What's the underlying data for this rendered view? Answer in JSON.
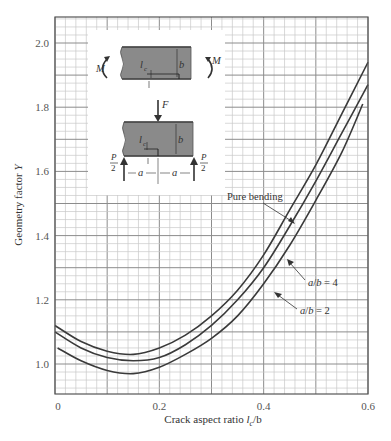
{
  "chart_data": {
    "type": "line",
    "title": "",
    "xlabel": "Crack aspect ratio l_c/b",
    "xlabel_main": "Crack aspect ratio ",
    "xlabel_var": "l",
    "xlabel_sub": "c",
    "xlabel_tail": "/b",
    "ylabel": "Geometry factor Y",
    "ylabel_main": "Geometry factor ",
    "ylabel_var": "Y",
    "xlim": [
      0,
      0.6
    ],
    "ylim": [
      0.9,
      2.08
    ],
    "x_ticks": [
      0,
      0.2,
      0.4,
      0.6
    ],
    "x_tick_labels": [
      "0",
      "0.2",
      "0.4",
      "0.6"
    ],
    "y_ticks": [
      1.0,
      1.2,
      1.4,
      1.6,
      1.8,
      2.0
    ],
    "y_tick_labels": [
      "1.0",
      "1.2",
      "1.4",
      "1.6",
      "1.8",
      "2.0"
    ],
    "grid": true,
    "legend": "inline annotations with leader arrows",
    "series": [
      {
        "name": "Pure bending",
        "x": [
          0,
          0.05,
          0.1,
          0.15,
          0.2,
          0.25,
          0.3,
          0.35,
          0.4,
          0.45,
          0.5,
          0.55,
          0.6
        ],
        "values": [
          1.12,
          1.07,
          1.04,
          1.03,
          1.05,
          1.09,
          1.15,
          1.23,
          1.34,
          1.48,
          1.62,
          1.78,
          1.94
        ]
      },
      {
        "name": "a/b = 4",
        "x": [
          0,
          0.05,
          0.1,
          0.15,
          0.2,
          0.25,
          0.3,
          0.35,
          0.4,
          0.45,
          0.5,
          0.55,
          0.6
        ],
        "values": [
          1.1,
          1.05,
          1.02,
          1.01,
          1.02,
          1.06,
          1.12,
          1.2,
          1.3,
          1.43,
          1.57,
          1.72,
          1.87
        ]
      },
      {
        "name": "a/b = 2",
        "x": [
          0.005,
          0.05,
          0.1,
          0.15,
          0.2,
          0.25,
          0.3,
          0.35,
          0.4,
          0.45,
          0.5,
          0.55,
          0.59
        ],
        "values": [
          1.05,
          1.01,
          0.98,
          0.97,
          0.99,
          1.03,
          1.08,
          1.15,
          1.25,
          1.37,
          1.51,
          1.66,
          1.81
        ]
      }
    ],
    "annotations": [
      {
        "text": "Pure bending",
        "target_series": "Pure bending"
      },
      {
        "text": "a/b = 4",
        "target_series": "a/b = 4"
      },
      {
        "text": "a/b = 2",
        "target_series": "a/b = 2"
      }
    ],
    "inset": {
      "description": "Specimen sketches: pure bending (top) and three-point bending (bottom)",
      "labels": {
        "moment": "M",
        "crack_length": "l",
        "crack_sub": "c",
        "height": "b",
        "force": "F",
        "support_num": "P",
        "support_den": "2",
        "span": "a"
      },
      "specimen_color": "#8a8a8a"
    }
  },
  "colors": {
    "curve": "#3a3a3a",
    "grid_minor": "#c8c8c8",
    "grid_major": "#8c8c8c",
    "frame": "#555555"
  }
}
